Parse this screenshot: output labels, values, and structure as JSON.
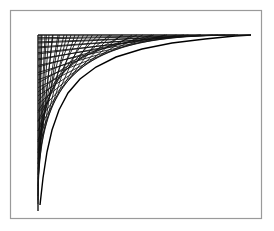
{
  "figure": {
    "title": "Envelope of straight line segments forming a hyperbolic corner curve",
    "background_color": "#ffffff",
    "canvas": {
      "width": 274,
      "height": 231
    },
    "frame": {
      "label": "outer border rectangle",
      "x": 10.5,
      "y": 10.5,
      "width": 251,
      "height": 208,
      "stroke_color": "#9a9a9a",
      "stroke_width": 1.2,
      "fill": "none"
    },
    "axes": {
      "label": "corner axes of the envelope construction",
      "origin_x": 38,
      "origin_y": 35,
      "vertical_end_y": 211,
      "horizontal_end_x": 251,
      "stroke_color": "#1a1a1a",
      "stroke_width": 1.0
    },
    "envelope": {
      "type": "line-segment-envelope",
      "description": "Two interleaved families of chords drawn between a vertical ruler and a horizontal ruler, tangent to a common hyperbola-like curve.",
      "stroke_color": "#111111",
      "stroke_width": 0.85,
      "family_a": {
        "name": "chords-from-top-edge",
        "count": 22,
        "anchor_axis": "horizontal-top",
        "target_axis": "vertical-left",
        "spacing_mode": "geometric"
      },
      "family_b": {
        "name": "chords-from-left-edge",
        "count": 22,
        "anchor_axis": "vertical-left",
        "target_axis": "horizontal-top",
        "spacing_mode": "geometric"
      },
      "curve": {
        "name": "hyperbolic-envelope",
        "asymptote_x": 38,
        "asymptote_y": 35,
        "stroke_color": "#000000",
        "stroke_width": 1.4
      }
    }
  },
  "chart_data": {
    "type": "line",
    "title": "Envelope of straight line segments forming a hyperbolic corner curve",
    "xlabel": "",
    "ylabel": "",
    "xlim": [
      38,
      251
    ],
    "ylim": [
      35,
      211
    ],
    "grid": false,
    "legend": "none",
    "series": [
      {
        "name": "vertical-axis",
        "x": [
          38,
          38
        ],
        "y": [
          35,
          211
        ]
      },
      {
        "name": "horizontal-axis",
        "x": [
          38,
          251
        ],
        "y": [
          35,
          35
        ]
      },
      {
        "name": "hyperbolic-envelope",
        "description": "Curve tangent to every chord; asymptotic to both axes.",
        "x": [
          40,
          43,
          47,
          52,
          59,
          68,
          80,
          96,
          116,
          142,
          172,
          205,
          235,
          251
        ],
        "y": [
          205,
          178,
          152,
          130,
          110,
          93,
          79,
          67,
          57,
          49,
          43,
          39,
          36,
          35
        ]
      }
    ],
    "chord_endpoints": {
      "description": "Each chord joins one point on the vertical axis to one point on the horizontal axis.",
      "vertical_axis_points_y": [
        35,
        39,
        43,
        48,
        54,
        60,
        67,
        75,
        83,
        92,
        101,
        111,
        121,
        131,
        142,
        153,
        164,
        175,
        186,
        196,
        204,
        211
      ],
      "horizontal_axis_points_x": [
        251,
        235,
        218,
        201,
        184,
        167,
        152,
        137,
        123,
        110,
        98,
        88,
        79,
        71,
        64,
        58,
        53,
        49,
        45,
        42,
        40,
        38
      ]
    }
  }
}
